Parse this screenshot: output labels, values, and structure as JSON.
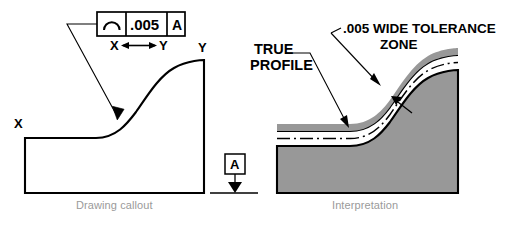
{
  "drawing_callout": {
    "caption": "Drawing callout",
    "feature_control_frame": {
      "symbol_name": "profile-of-a-surface-symbol",
      "symbol_char": "⌒",
      "tolerance": ".005",
      "datum": "A"
    },
    "between_symbol": {
      "from": "X",
      "to": "Y",
      "arrow": "↔"
    },
    "part_labels": {
      "left_point": "X",
      "right_point": "Y"
    },
    "datum_feature": {
      "letter": "A"
    }
  },
  "interpretation": {
    "caption": "Interpretation",
    "labels": {
      "true_profile_line1": "TRUE",
      "true_profile_line2": "PROFILE",
      "tolerance_zone_line1": ".005 WIDE TOLERANCE",
      "tolerance_zone_line2": "ZONE"
    }
  },
  "colors": {
    "line": "#000000",
    "material_fill": "#989898",
    "caption_text": "#9a9a9a",
    "background": "#ffffff"
  }
}
